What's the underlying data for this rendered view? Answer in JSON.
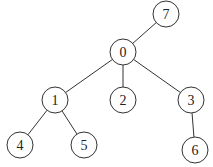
{
  "diagram": {
    "type": "tree",
    "nodes": [
      {
        "id": "7",
        "label": "7"
      },
      {
        "id": "0",
        "label": "0"
      },
      {
        "id": "1",
        "label": "1"
      },
      {
        "id": "2",
        "label": "2"
      },
      {
        "id": "3",
        "label": "3"
      },
      {
        "id": "4",
        "label": "4"
      },
      {
        "id": "5",
        "label": "5"
      },
      {
        "id": "6",
        "label": "6"
      }
    ],
    "edges": [
      {
        "from": "7",
        "to": "0"
      },
      {
        "from": "0",
        "to": "1"
      },
      {
        "from": "0",
        "to": "2"
      },
      {
        "from": "0",
        "to": "3"
      },
      {
        "from": "1",
        "to": "4"
      },
      {
        "from": "1",
        "to": "5"
      },
      {
        "from": "3",
        "to": "6"
      }
    ]
  }
}
